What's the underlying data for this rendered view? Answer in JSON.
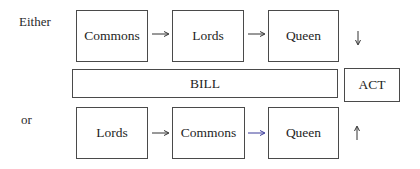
{
  "row_labels": {
    "either": "Either",
    "or": "or"
  },
  "top_row": {
    "boxes": [
      "Commons",
      "Lords",
      "Queen"
    ],
    "direction_icon": "down-arrow"
  },
  "middle_row": {
    "bill": "BILL",
    "act": "ACT"
  },
  "bottom_row": {
    "boxes": [
      "Lords",
      "Commons",
      "Queen"
    ],
    "direction_icon": "up-arrow"
  },
  "colors": {
    "border": "#4a4a4a",
    "text": "#1e1e1e",
    "arrow": "#333333",
    "accent_arrow": "#3a3a9a"
  }
}
